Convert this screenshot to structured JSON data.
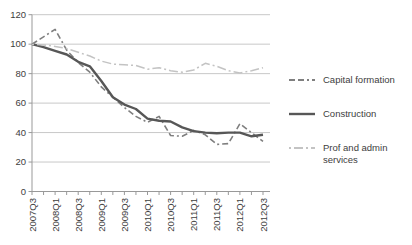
{
  "chart_data": {
    "type": "line",
    "title": "",
    "xlabel": "",
    "ylabel": "",
    "ylim": [
      0,
      120
    ],
    "y_ticks": [
      0,
      20,
      40,
      60,
      80,
      100,
      120
    ],
    "y_tick_labels": [
      "0",
      "20",
      "40",
      "60",
      "80",
      "100",
      "120"
    ],
    "grid": true,
    "legend_position": "right",
    "x": [
      "2007Q3",
      "2007Q4",
      "2008Q1",
      "2008Q2",
      "2008Q3",
      "2008Q4",
      "2009Q1",
      "2009Q2",
      "2009Q3",
      "2009Q4",
      "2010Q1",
      "2010Q2",
      "2010Q3",
      "2010Q4",
      "2011Q1",
      "2011Q2",
      "2011Q3",
      "2011Q4",
      "2012Q1",
      "2012Q2",
      "2012Q3"
    ],
    "x_tick_labels": [
      "2007Q3",
      "2008Q1",
      "2008Q3",
      "2009Q1",
      "2009Q3",
      "2010Q1",
      "2010Q3",
      "2011Q1",
      "2011Q3",
      "2012Q1",
      "2012Q3"
    ],
    "series": [
      {
        "name": "Capital formation",
        "values": [
          100,
          105,
          110,
          96,
          87.5,
          81,
          71,
          64,
          57,
          51,
          47,
          51,
          38,
          37.5,
          41.5,
          38.5,
          32,
          32.5,
          46,
          40,
          34
        ],
        "color": "#7f7f7f",
        "dash": "6 3 6 3 2 3",
        "width": 1.6
      },
      {
        "name": "Construction",
        "values": [
          100,
          98,
          95.5,
          93,
          88,
          85,
          75,
          64,
          59,
          56,
          49.5,
          48,
          47.5,
          43.5,
          41,
          40,
          39.5,
          40,
          40,
          37.5,
          38.5
        ],
        "color": "#575757",
        "dash": "",
        "width": 2.4
      },
      {
        "name": "Prof and admin services",
        "values": [
          100,
          99.5,
          98.5,
          97,
          94.5,
          92,
          88.5,
          86.5,
          86,
          85.5,
          83,
          84,
          82,
          81,
          82.5,
          87,
          85,
          82,
          80.5,
          82,
          84
        ],
        "color": "#c3c3c3",
        "dash": "2 3 9 3",
        "width": 1.5
      }
    ],
    "colors": {
      "gridline": "#c8c8c8",
      "axis": "#999999",
      "tick_text": "#3d3d3d"
    }
  }
}
